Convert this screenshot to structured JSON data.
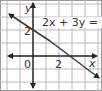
{
  "graph": {
    "equation_label": "2x + 3y = 6",
    "x_axis_label": "x",
    "y_axis_label": "y",
    "origin_label": "0",
    "x_tick_label": "2",
    "y_tick_label": "2",
    "grid_color": "#b8b8b8",
    "axis_color": "#222222",
    "line_color": "#3a3a3a",
    "line": {
      "y_intercept": 2,
      "x_intercept": 3,
      "slope": "-2/3"
    }
  }
}
